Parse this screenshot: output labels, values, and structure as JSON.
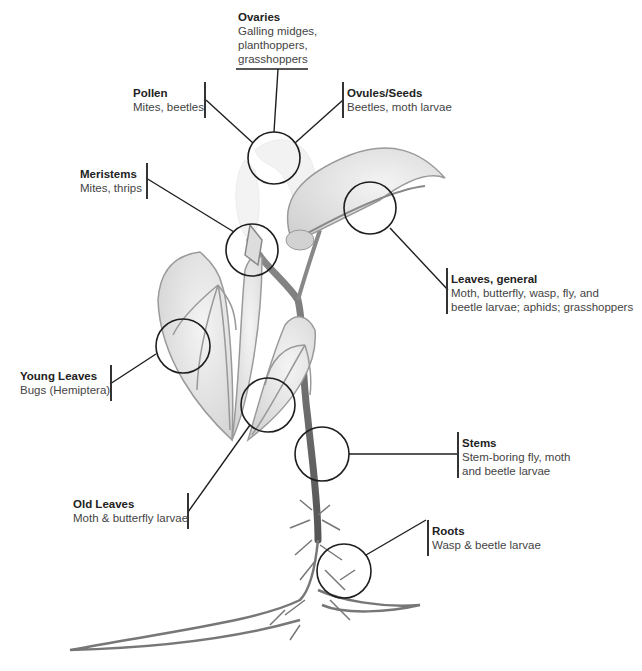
{
  "figure": {
    "labels": {
      "ovaries": {
        "title": "Ovaries",
        "lines": [
          "Galling midges,",
          "planthoppers,",
          "grasshoppers"
        ]
      },
      "pollen": {
        "title": "Pollen",
        "lines": [
          "Mites, beetles"
        ]
      },
      "ovules": {
        "title": "Ovules/Seeds",
        "lines": [
          "Beetles, moth larvae"
        ]
      },
      "meristems": {
        "title": "Meristems",
        "lines": [
          "Mites, thrips"
        ]
      },
      "leaves_general": {
        "title": "Leaves, general",
        "lines": [
          "Moth, butterfly, wasp, fly, and",
          "beetle larvae; aphids; grasshoppers"
        ]
      },
      "young_leaves": {
        "title": "Young Leaves",
        "lines": [
          "Bugs (Hemiptera)"
        ]
      },
      "stems": {
        "title": "Stems",
        "lines": [
          "Stem-boring fly, moth",
          "and beetle larvae"
        ]
      },
      "old_leaves": {
        "title": "Old Leaves",
        "lines": [
          "Moth & butterfly larvae"
        ]
      },
      "roots": {
        "title": "Roots",
        "lines": [
          "Wasp & beetle larvae"
        ]
      }
    },
    "colors": {
      "line": "#222222",
      "leaf_fill": "#e6e6e6",
      "leaf_edge": "#9a9a9a",
      "stem": "#7a7a7a",
      "flower": "#eeeeee"
    }
  }
}
